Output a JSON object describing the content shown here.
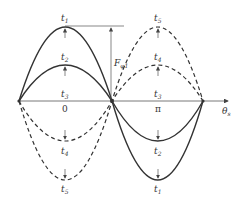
{
  "diagram": {
    "type": "waveform",
    "axis": {
      "label_main": "θ",
      "label_sub": "s",
      "ticks": [
        "0",
        "π"
      ]
    },
    "amplitude_label": {
      "main": "F",
      "sub": "φ1"
    },
    "curves": [
      {
        "id": "t1",
        "style": "solid",
        "label_top": "t",
        "label_top_sub": "1",
        "label_bottom": "t",
        "label_bottom_sub": "1"
      },
      {
        "id": "t2",
        "style": "solid",
        "label_top": "t",
        "label_top_sub": "2",
        "label_bottom": "t",
        "label_bottom_sub": "2"
      },
      {
        "id": "t3",
        "style": "flat",
        "label_left": "t",
        "label_left_sub": "3",
        "label_right": "t",
        "label_right_sub": "3"
      },
      {
        "id": "t4",
        "style": "dashed",
        "label_top": "t",
        "label_top_sub": "4",
        "label_bottom": "t",
        "label_bottom_sub": "4"
      },
      {
        "id": "t5",
        "style": "dashed",
        "label_top": "t",
        "label_top_sub": "5",
        "label_bottom": "t",
        "label_bottom_sub": "5"
      }
    ],
    "colors": {
      "stroke": "#333333",
      "axis": "#555555"
    }
  }
}
